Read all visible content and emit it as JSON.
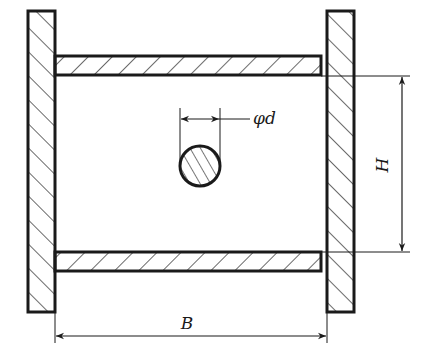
{
  "diagram": {
    "type": "engineering cross-section drawing",
    "colors": {
      "line": "#1a1a1a",
      "background": "#ffffff"
    },
    "parts": [
      {
        "name": "left-plate",
        "hatched": true
      },
      {
        "name": "right-plate",
        "hatched": true
      },
      {
        "name": "top-flange",
        "hatched": true
      },
      {
        "name": "bottom-flange",
        "hatched": true
      },
      {
        "name": "round-rod",
        "hatched": true
      }
    ],
    "dimensions": {
      "diameter": {
        "label": "φd",
        "refers_to": "round-rod diameter"
      },
      "height": {
        "label": "H",
        "refers_to": "distance between flange tops"
      },
      "width": {
        "label": "B",
        "refers_to": "inner width between side plates"
      }
    }
  }
}
